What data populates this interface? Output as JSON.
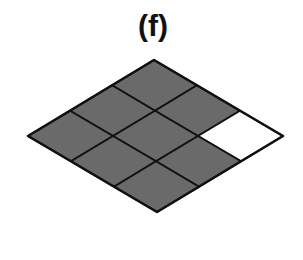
{
  "figure": {
    "label": "(f)",
    "shape": "rhombus grid",
    "grid_rows": 3,
    "grid_cols": 3,
    "vertices": {
      "top": [
        154,
        60
      ],
      "right": [
        283,
        136
      ],
      "bottom": [
        155,
        214
      ],
      "left": [
        28,
        136
      ]
    },
    "colors": {
      "shaded": "#6a6a6a",
      "unshaded": "#ffffff",
      "stroke": "#111111"
    },
    "cells": [
      {
        "u": 0,
        "v": 0,
        "shaded": true
      },
      {
        "u": 1,
        "v": 0,
        "shaded": true
      },
      {
        "u": 2,
        "v": 0,
        "shaded": false
      },
      {
        "u": 0,
        "v": 1,
        "shaded": true
      },
      {
        "u": 1,
        "v": 1,
        "shaded": true
      },
      {
        "u": 2,
        "v": 1,
        "shaded": true
      },
      {
        "u": 0,
        "v": 2,
        "shaded": true
      },
      {
        "u": 1,
        "v": 2,
        "shaded": true
      },
      {
        "u": 2,
        "v": 2,
        "shaded": true
      }
    ],
    "shaded_count": 8,
    "total_cells": 9
  }
}
